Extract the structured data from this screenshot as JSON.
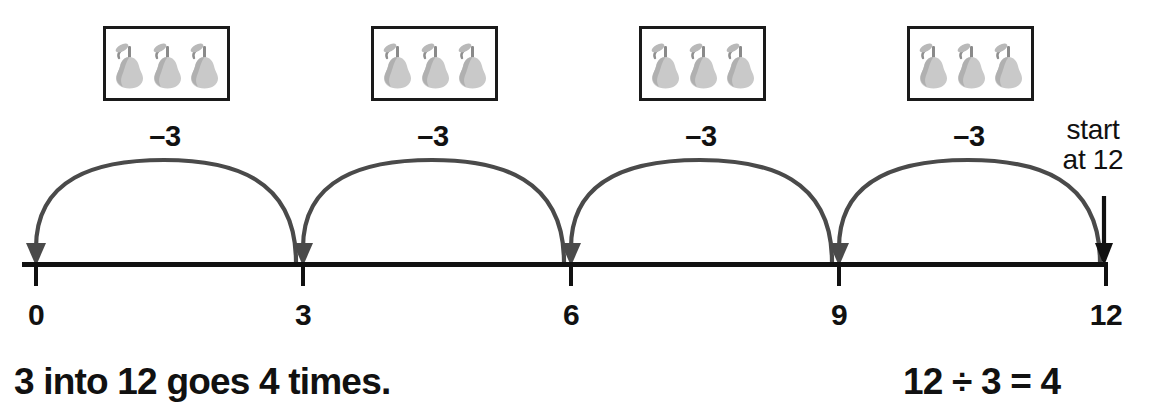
{
  "diagram": {
    "number_line": {
      "ticks": [
        {
          "value": 0,
          "label": "0"
        },
        {
          "value": 3,
          "label": "3"
        },
        {
          "value": 6,
          "label": "6"
        },
        {
          "value": 9,
          "label": "9"
        },
        {
          "value": 12,
          "label": "12"
        }
      ],
      "min": 0,
      "max": 12,
      "step": 3
    },
    "jumps": [
      {
        "label": "–3",
        "from": 12,
        "to": 9
      },
      {
        "label": "–3",
        "from": 9,
        "to": 6
      },
      {
        "label": "–3",
        "from": 6,
        "to": 3
      },
      {
        "label": "–3",
        "from": 3,
        "to": 0
      }
    ],
    "groups": [
      {
        "count": 3,
        "item": "pear"
      },
      {
        "count": 3,
        "item": "pear"
      },
      {
        "count": 3,
        "item": "pear"
      },
      {
        "count": 3,
        "item": "pear"
      }
    ],
    "start_annotation": {
      "line1": "start",
      "line2": "at 12",
      "arrow": "down-arrow-icon"
    },
    "captions": {
      "left": "3 into 12 goes 4 times.",
      "right": "12 ÷ 3 = 4"
    },
    "colors": {
      "line": "#111111",
      "arc": "#4a4a4a",
      "pear_body": "#c9c9c9",
      "pear_shade": "#b0b0b0",
      "box_border": "#1a1a1a",
      "text": "#111111"
    }
  }
}
